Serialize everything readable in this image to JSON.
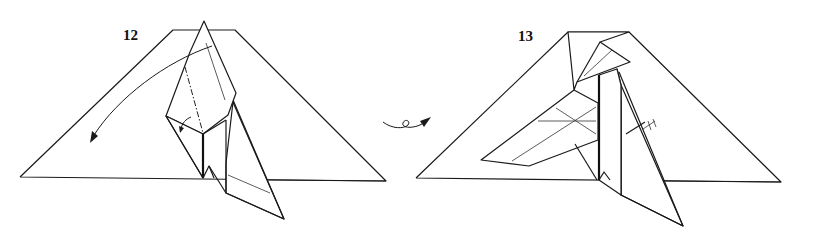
{
  "diagram": {
    "type": "origami-folding-instructions",
    "steps": [
      {
        "number": "12",
        "instructions": [
          "valley-fold flap down (arrow)",
          "mountain-fold small flap behind (small arrow)"
        ],
        "fold_lines": [
          "mountain-fold",
          "valley-fold"
        ]
      },
      {
        "number": "13",
        "instructions": [
          "equal-distance marks on right edge"
        ],
        "fold_lines": []
      }
    ],
    "transition_symbol": "turn-over-icon",
    "colors": {
      "line": "#1a1a1a",
      "background": "#ffffff"
    }
  }
}
